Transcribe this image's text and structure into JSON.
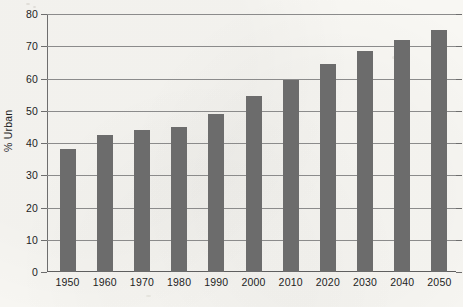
{
  "chart_data": {
    "type": "bar",
    "title": "",
    "subtitle": "",
    "xlabel": "",
    "ylabel": "% Urban",
    "categories": [
      "1950",
      "1960",
      "1970",
      "1980",
      "1990",
      "2000",
      "2010",
      "2020",
      "2030",
      "2040",
      "2050"
    ],
    "values": [
      38,
      42.5,
      44,
      45,
      49,
      54.5,
      59.5,
      64.5,
      68.5,
      72,
      75
    ],
    "series": [
      {
        "name": "% Urban",
        "values": [
          38,
          42.5,
          44,
          45,
          49,
          54.5,
          59.5,
          64.5,
          68.5,
          72,
          75
        ],
        "color": "#6c6c6c"
      }
    ],
    "ylim": [
      0,
      80
    ],
    "yticks": [
      0,
      10,
      20,
      30,
      40,
      50,
      60,
      70,
      80
    ],
    "ytick_labels": [
      "0",
      "10",
      "20",
      "30",
      "40",
      "50",
      "60",
      "70",
      "80"
    ],
    "grid": true,
    "grid_axis": "y",
    "legend": false,
    "legend_position": "none",
    "annotations": [],
    "bar_color": "#6c6c6c",
    "background_color": "#f8f7f3",
    "axis_color": "#6e6e6e",
    "gridline_color": "#8b8b8b",
    "text_color": "#1d1d1d"
  }
}
